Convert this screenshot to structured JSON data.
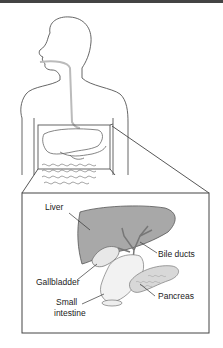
{
  "diagram": {
    "labels": {
      "liver": "Liver",
      "bile_ducts": "Bile ducts",
      "gallbladder": "Gallbladder",
      "pancreas": "Pancreas",
      "small_intestine_line1": "Small",
      "small_intestine_line2": "intestine"
    },
    "colors": {
      "outline": "#555555",
      "liver_fill": "#a8a8a8",
      "inset_border": "#444444",
      "esophagus": "#bbbbbb"
    }
  }
}
